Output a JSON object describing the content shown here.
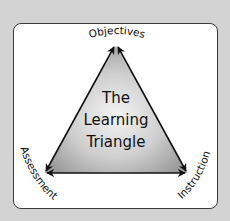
{
  "diagram": {
    "title_lines": [
      "The",
      "Learning",
      "Triangle"
    ],
    "vertices": {
      "top": "Objectives",
      "bottom_left": "Assessment",
      "bottom_right": "Instruction"
    },
    "edges": [
      {
        "from": "Objectives",
        "to": "Assessment",
        "arrows": "both"
      },
      {
        "from": "Assessment",
        "to": "Instruction",
        "arrows": "both"
      },
      {
        "from": "Instruction",
        "to": "Objectives",
        "arrows": "both"
      }
    ],
    "colors": {
      "background": "#d3d3d3",
      "frame": "#ffffff",
      "triangle_center": "#f2f2f2",
      "triangle_edge": "#9a9a9a",
      "arrows": "#111111"
    }
  }
}
